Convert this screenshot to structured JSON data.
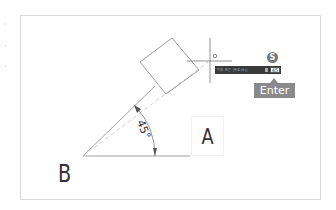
{
  "diagram": {
    "point_labels": {
      "a": "A",
      "b": "B"
    },
    "angle": {
      "value": "45°"
    },
    "cursor_tooltip": {
      "prompt_text": "지정 또는 [특성(R)]",
      "input_value": "45"
    },
    "step_badge": "S",
    "enter_key": "Enter",
    "colors": {
      "line": "#888888",
      "dashed_line": "#cccccc",
      "tooltip_bg": "#3a3a3a",
      "badge_bg": "#777777",
      "enter_bg": "#8a8a8a",
      "frame_border": "#d8d8d8"
    }
  }
}
